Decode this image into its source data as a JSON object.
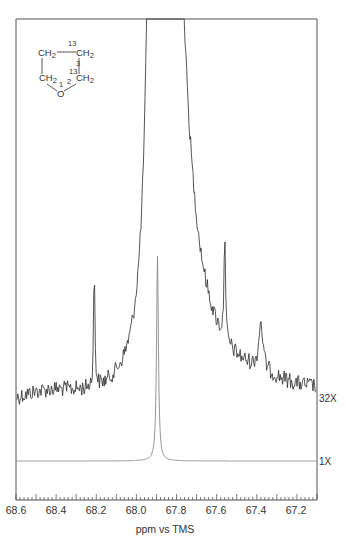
{
  "chart_data": {
    "type": "line",
    "title": "",
    "xlabel": "ppm vs TMS",
    "ylabel": "",
    "xlim": [
      68.6,
      67.1
    ],
    "x_reversed": true,
    "grid": false,
    "x_ticks": [
      "68.6",
      "68.4",
      "68.2",
      "68.0",
      "67.8",
      "67.6",
      "67.4",
      "67.2"
    ],
    "x_tick_values": [
      68.6,
      68.4,
      68.2,
      68.0,
      67.8,
      67.6,
      67.4,
      67.2
    ],
    "minor_tick_step": 0.02,
    "series": [
      {
        "name": "32X",
        "gain_label": "32X",
        "description": "Vertically expanded (32x) trace showing 13C satellite lines, noisy baseline; main peak off-scale",
        "peaks": [
          {
            "ppm": 67.895,
            "label": "main peak (off scale)",
            "relative_height": "off-scale"
          },
          {
            "ppm": 68.21,
            "label": "satellite",
            "relative_height": 0.5
          },
          {
            "ppm": 67.56,
            "label": "satellite",
            "relative_height": 0.48
          },
          {
            "ppm": 67.38,
            "label": "small peak",
            "relative_height": 0.2
          }
        ]
      },
      {
        "name": "1X",
        "gain_label": "1X",
        "description": "Normal (1x) trace with single sharp peak",
        "peaks": [
          {
            "ppm": 67.895,
            "label": "main peak",
            "relative_height": 1.0
          }
        ]
      }
    ],
    "annotations": [
      {
        "type": "structure",
        "label": "tetrahydrofuran ring labeled with two 13C carbons",
        "atoms": [
          "CH2",
          "CH2",
          "CH2",
          "CH2",
          "O"
        ],
        "numbers": [
          "13",
          "13",
          "3",
          "2",
          "1"
        ]
      }
    ]
  },
  "labels": {
    "xlabel": "ppm vs TMS",
    "gain_top": "32X",
    "gain_bottom": "1X",
    "ticks": [
      "68.6",
      "68.4",
      "68.2",
      "68.0",
      "67.8",
      "67.6",
      "67.4",
      "67.2"
    ]
  },
  "structure": {
    "ch2_top_left": "CH",
    "ch2_top_right": "CH",
    "ch2_bottom_left": "CH",
    "ch2_bottom_right": "CH",
    "sub2": "2",
    "oxygen": "O",
    "label_13_top": "13",
    "label_13_mid": "13",
    "label_3": "3",
    "label_2": "2",
    "label_1": "1"
  }
}
